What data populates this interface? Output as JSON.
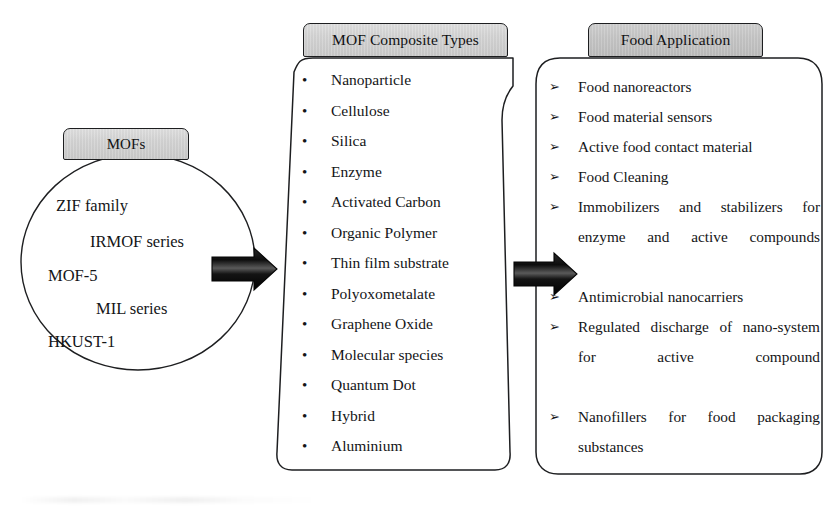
{
  "left": {
    "tab_label": "MOFs",
    "circle_items": [
      "ZIF family",
      "IRMOF series",
      "MOF-5",
      "MIL series",
      "HKUST-1"
    ]
  },
  "middle": {
    "tab_label": "MOF Composite Types",
    "bullet_glyph": "•",
    "items": [
      "Nanoparticle",
      "Cellulose",
      "Silica",
      "Enzyme",
      "Activated Carbon",
      "Organic Polymer",
      "Thin film substrate",
      "Polyoxometalate",
      "Graphene Oxide",
      "Molecular species",
      "Quantum Dot",
      "Hybrid",
      "Aluminium"
    ]
  },
  "right": {
    "tab_label": "Food Application",
    "bullet_glyph": "➢",
    "items": [
      "Food nanoreactors",
      "Food material sensors",
      "Active food contact material",
      "Food Cleaning",
      "Immobilizers and stabilizers for enzyme and active compounds",
      "Antimicrobial nanocarriers",
      "Regulated discharge of nano-system for active compound",
      "Nanofillers for food packaging substances"
    ]
  },
  "arrows": [
    {
      "name": "arrow-mofs-to-composites"
    },
    {
      "name": "arrow-composites-to-application"
    }
  ],
  "colors": {
    "tab_fill_light": "#d6d6d6",
    "tab_fill_dark": "#c6c6c6",
    "outline": "#1d1e20",
    "text": "#141517",
    "arrow_dark": "#101010",
    "page_background": "#ffffff"
  }
}
